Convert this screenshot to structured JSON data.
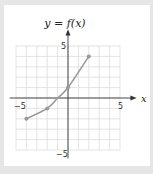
{
  "chart_data": {
    "type": "line",
    "title": "y = f(x)",
    "xlabel": "x",
    "ylabel": "",
    "xlim": [
      -6,
      6
    ],
    "ylim": [
      -6,
      6
    ],
    "grid": true,
    "x_tick_labels": [
      "-5",
      "5"
    ],
    "y_tick_labels": [
      "5",
      "-5"
    ],
    "series": [
      {
        "name": "f(x)",
        "x": [
          -4,
          -2,
          -1,
          0,
          2
        ],
        "y": [
          -2,
          -1,
          0,
          1,
          4
        ]
      }
    ],
    "marked_points": [
      {
        "x": -4,
        "y": -2
      },
      {
        "x": -2,
        "y": -1
      },
      {
        "x": 0,
        "y": 1
      },
      {
        "x": 2,
        "y": 4
      }
    ],
    "colors": {
      "curve": "#9a9a9a",
      "grid": "#dcdcdc",
      "axis": "#333333",
      "frame_bg": "#e6e6e6"
    }
  },
  "labels": {
    "title": "y = f(x)",
    "x_axis": "x",
    "x_min": "−5",
    "x_max": "5",
    "y_max": "5",
    "y_min": "−5"
  }
}
